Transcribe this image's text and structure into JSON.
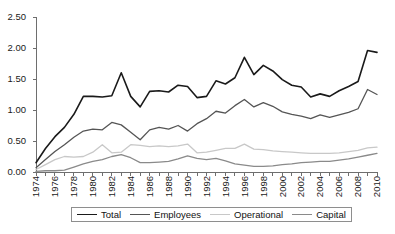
{
  "chart_data": {
    "type": "line",
    "title": "",
    "subtitle": "",
    "xlabel": "",
    "ylabel": "",
    "grid": false,
    "legend_position": "bottom",
    "xlim": [
      1974,
      2010
    ],
    "ylim": [
      0.0,
      2.5
    ],
    "ytick_labels": [
      "0.00",
      "0.50",
      "1.00",
      "1.50",
      "2.00",
      "2.50"
    ],
    "ytick_values": [
      0.0,
      0.5,
      1.0,
      1.5,
      2.0,
      2.5
    ],
    "x": [
      1974,
      1975,
      1976,
      1977,
      1978,
      1979,
      1980,
      1981,
      1982,
      1983,
      1984,
      1985,
      1986,
      1987,
      1988,
      1989,
      1990,
      1991,
      1992,
      1993,
      1994,
      1995,
      1996,
      1997,
      1998,
      1999,
      2000,
      2001,
      2002,
      2003,
      2004,
      2005,
      2006,
      2007,
      2008,
      2009,
      2010
    ],
    "xtick_labels": [
      "1974",
      "1976",
      "1978",
      "1980",
      "1982",
      "1984",
      "1986",
      "1988",
      "1990",
      "1992",
      "1994",
      "1996",
      "1998",
      "2000",
      "2002",
      "2004",
      "2006",
      "2008",
      "2010"
    ],
    "xtick_label_step": 2,
    "minor_ticks": "every year",
    "series": [
      {
        "name": "Total",
        "color": "#1a1a1a",
        "width": 1.6,
        "values": [
          0.15,
          0.38,
          0.57,
          0.72,
          0.93,
          1.22,
          1.22,
          1.21,
          1.23,
          1.6,
          1.22,
          1.05,
          1.3,
          1.31,
          1.29,
          1.4,
          1.38,
          1.2,
          1.22,
          1.47,
          1.42,
          1.52,
          1.85,
          1.57,
          1.72,
          1.63,
          1.49,
          1.4,
          1.37,
          1.21,
          1.26,
          1.22,
          1.31,
          1.38,
          1.46,
          1.96,
          1.93
        ]
      },
      {
        "name": "Employees",
        "color": "#555555",
        "width": 1.3,
        "values": [
          0.07,
          0.2,
          0.33,
          0.44,
          0.56,
          0.66,
          0.69,
          0.68,
          0.8,
          0.76,
          0.64,
          0.52,
          0.68,
          0.72,
          0.69,
          0.75,
          0.66,
          0.78,
          0.86,
          0.98,
          0.95,
          1.07,
          1.17,
          1.05,
          1.12,
          1.06,
          0.97,
          0.93,
          0.9,
          0.86,
          0.92,
          0.88,
          0.92,
          0.96,
          1.02,
          1.33,
          1.25
        ]
      },
      {
        "name": "Operational",
        "color": "#c8c8c8",
        "width": 1.3,
        "values": [
          0.04,
          0.12,
          0.2,
          0.25,
          0.24,
          0.25,
          0.32,
          0.44,
          0.31,
          0.32,
          0.44,
          0.43,
          0.41,
          0.42,
          0.41,
          0.42,
          0.45,
          0.31,
          0.32,
          0.35,
          0.38,
          0.38,
          0.45,
          0.37,
          0.36,
          0.34,
          0.33,
          0.32,
          0.31,
          0.3,
          0.3,
          0.3,
          0.31,
          0.33,
          0.35,
          0.39,
          0.4
        ]
      },
      {
        "name": "Capital",
        "color": "#8a8a8a",
        "width": 1.3,
        "values": [
          0.01,
          0.02,
          0.02,
          0.03,
          0.08,
          0.13,
          0.17,
          0.2,
          0.25,
          0.28,
          0.23,
          0.15,
          0.15,
          0.16,
          0.17,
          0.21,
          0.26,
          0.22,
          0.2,
          0.22,
          0.18,
          0.13,
          0.11,
          0.09,
          0.09,
          0.1,
          0.12,
          0.13,
          0.15,
          0.16,
          0.17,
          0.17,
          0.19,
          0.21,
          0.24,
          0.27,
          0.3
        ]
      }
    ]
  },
  "legend": {
    "items": [
      {
        "label": "Total",
        "color": "#1a1a1a",
        "width": "1.6px"
      },
      {
        "label": "Employees",
        "color": "#555555",
        "width": "1.3px"
      },
      {
        "label": "Operational",
        "color": "#c8c8c8",
        "width": "1.3px"
      },
      {
        "label": "Capital",
        "color": "#8a8a8a",
        "width": "1.3px"
      }
    ]
  },
  "axes": {
    "axis_color": "#6e6e6e",
    "tick_color": "#6e6e6e",
    "label_color": "#1a1a1a"
  }
}
